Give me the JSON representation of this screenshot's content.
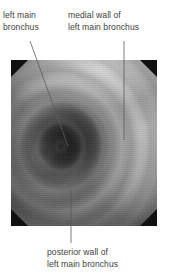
{
  "figure": {
    "kind": "annotated-bronchoscopy-photograph",
    "background_color": "#ffffff",
    "text_color": "#414141"
  },
  "annotations": {
    "left_main_bronchus": {
      "line1": "left main",
      "line2": "bronchus",
      "leader": "diagonal",
      "points_to": "airway lumen"
    },
    "medial_wall": {
      "line1": "medial wall of",
      "line2": "left main bronchus",
      "leader": "vertical",
      "points_to": "right-hand ridged wall"
    },
    "posterior_wall": {
      "line1": "posterior wall of",
      "line2": "left main bronchus",
      "leader": "vertical",
      "points_to": "lower wall"
    }
  },
  "photo": {
    "corner_mask_color": "#111111",
    "lumen_color": "#1d1d1d",
    "wall_highlight_color": "#d6d6d6",
    "mid_tone_color": "#9a9a9a"
  },
  "leader_lines": {
    "stroke_color": "#5a5a5a",
    "stroke_width": 0.8,
    "segments": [
      {
        "name": "left-main-bronchus-leader",
        "x1": 30,
        "y1": 41,
        "x2": 68,
        "y2": 146
      },
      {
        "name": "medial-wall-leader",
        "x1": 124,
        "y1": 41,
        "x2": 124,
        "y2": 140
      },
      {
        "name": "posterior-wall-leader",
        "x1": 71,
        "y1": 190,
        "x2": 71,
        "y2": 243
      }
    ]
  }
}
